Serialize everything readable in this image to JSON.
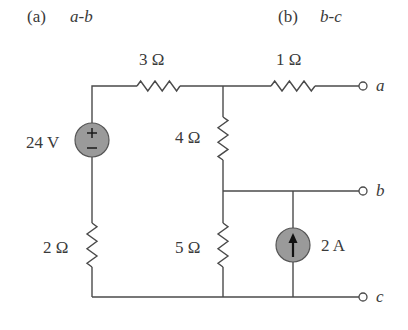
{
  "header": {
    "part_a": {
      "prefix": "(a)",
      "label": "a-b"
    },
    "part_b": {
      "prefix": "(b)",
      "label": "b-c"
    }
  },
  "components": {
    "r_top_left": {
      "label": "3 Ω",
      "value_ohms": 3
    },
    "r_top_right": {
      "label": "1 Ω",
      "value_ohms": 1
    },
    "r_middle_upper": {
      "label": "4 Ω",
      "value_ohms": 4
    },
    "r_middle_lower": {
      "label": "5 Ω",
      "value_ohms": 5
    },
    "r_left_lower": {
      "label": "2 Ω",
      "value_ohms": 2
    },
    "voltage_source": {
      "label": "24 V",
      "value_volts": 24,
      "plus": "+",
      "minus": "−"
    },
    "current_source": {
      "label": "2 A",
      "value_amps": 2,
      "direction": "up"
    }
  },
  "terminals": {
    "a": "a",
    "b": "b",
    "c": "c"
  },
  "colors": {
    "wire": "#4a4a4a",
    "source_fill": "#9a9a9a",
    "text": "#3a3a3a"
  }
}
